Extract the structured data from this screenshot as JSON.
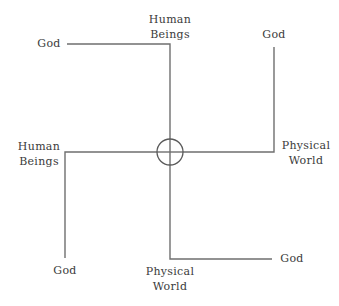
{
  "diagram": {
    "type": "concept-diagram",
    "colors": {
      "line": "#6f6f6f",
      "hub": "#5a5a5a",
      "text": "#3b3b3b",
      "background": "#ffffff"
    },
    "hub": {
      "shape": "circle",
      "cx": 170,
      "cy": 152,
      "r": 13
    },
    "arms": [
      {
        "id": "top",
        "path": [
          [
            170,
            152
          ],
          [
            170,
            44
          ],
          [
            67,
            44
          ]
        ],
        "labels": {
          "axis_end": "Human Beings",
          "hook_end": "God"
        }
      },
      {
        "id": "right",
        "path": [
          [
            170,
            152
          ],
          [
            274,
            152
          ],
          [
            274,
            47
          ]
        ],
        "labels": {
          "axis_end": "Physical World",
          "hook_end": "God"
        }
      },
      {
        "id": "left",
        "path": [
          [
            170,
            152
          ],
          [
            65,
            152
          ],
          [
            65,
            258
          ]
        ],
        "labels": {
          "axis_end": "Human Beings",
          "hook_end": "God"
        }
      },
      {
        "id": "bottom",
        "path": [
          [
            170,
            152
          ],
          [
            170,
            259
          ],
          [
            272,
            259
          ]
        ],
        "labels": {
          "axis_end": "Physical World",
          "hook_end": "God"
        }
      }
    ],
    "labels": {
      "top_left_god": "God",
      "top_human_line1": "Human",
      "top_human_line2": "Beings",
      "top_right_god": "God",
      "left_human_line1": "Human",
      "left_human_line2": "Beings",
      "right_physical_line1": "Physical",
      "right_physical_line2": "World",
      "bottom_left_god": "God",
      "bottom_physical_line1": "Physical",
      "bottom_physical_line2": "World",
      "bottom_right_god": "God"
    }
  }
}
